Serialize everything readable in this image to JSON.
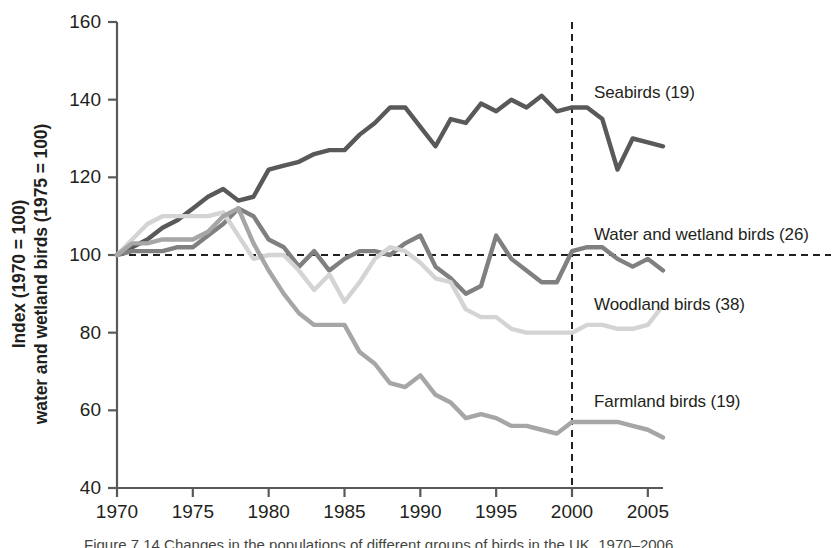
{
  "figure": {
    "background": "#ffffff",
    "plot_area": {
      "left": 117,
      "right": 663,
      "top": 22,
      "bottom": 488
    }
  },
  "axis": {
    "y_title_line1": "Index (1970 = 100)",
    "y_title_line2": "water and wetland birds (1975 = 100)",
    "y_ticks": [
      40,
      60,
      80,
      100,
      120,
      140,
      160
    ],
    "x_ticks": [
      1970,
      1975,
      1980,
      1985,
      1990,
      1995,
      2000,
      2005
    ],
    "axis_color": "#58595b"
  },
  "series_labels": [
    {
      "name": "seabirds-label",
      "text": "Seabirds (19)",
      "x": 594,
      "y": 83
    },
    {
      "name": "water-wetland-label",
      "text": "Water and wetland birds (26)",
      "x": 594,
      "y": 225
    },
    {
      "name": "woodland-label",
      "text": "Woodland birds (38)",
      "x": 594,
      "y": 295
    },
    {
      "name": "farmland-label",
      "text": "Farmland birds (19)",
      "x": 594,
      "y": 392
    }
  ],
  "reference_lines": {
    "horizontal_value": 100,
    "vertical_year": 2000,
    "color": "#231f20",
    "dash": "7,5"
  },
  "caption": "Figure 7.14 Changes in the populations of different groups of birds in the UK, 1970–2006",
  "chart_data": {
    "type": "line",
    "title": "",
    "xlabel": "",
    "ylabel": "Index (1970 = 100) water and wetland birds (1975 = 100)",
    "xlim": [
      1970,
      2006
    ],
    "ylim": [
      40,
      160
    ],
    "grid": false,
    "legend": "inline-right-labels",
    "x": [
      1970,
      1971,
      1972,
      1973,
      1974,
      1975,
      1976,
      1977,
      1978,
      1979,
      1980,
      1981,
      1982,
      1983,
      1984,
      1985,
      1986,
      1987,
      1988,
      1989,
      1990,
      1991,
      1992,
      1993,
      1994,
      1995,
      1996,
      1997,
      1998,
      1999,
      2000,
      2001,
      2002,
      2003,
      2004,
      2005,
      2006
    ],
    "series": [
      {
        "name": "Seabirds (19)",
        "color": "#595959",
        "count": 19,
        "values": [
          100,
          102,
          104,
          107,
          109,
          112,
          115,
          117,
          114,
          115,
          122,
          123,
          124,
          126,
          127,
          127,
          131,
          134,
          138,
          138,
          133,
          128,
          135,
          134,
          139,
          137,
          140,
          138,
          141,
          137,
          138,
          138,
          135,
          122,
          130,
          129,
          128
        ]
      },
      {
        "name": "Water and wetland birds (26)",
        "color": "#808080",
        "count": 26,
        "values": [
          100,
          101,
          101,
          101,
          102,
          102,
          105,
          108,
          112,
          110,
          104,
          102,
          97,
          101,
          96,
          99,
          101,
          101,
          100,
          103,
          105,
          97,
          94,
          90,
          92,
          105,
          99,
          96,
          93,
          93,
          101,
          102,
          102,
          99,
          97,
          99,
          96
        ]
      },
      {
        "name": "Woodland birds (38)",
        "color": "#d4d4d4",
        "count": 38,
        "values": [
          100,
          104,
          108,
          110,
          110,
          110,
          110,
          111,
          105,
          99,
          100,
          100,
          96,
          91,
          95,
          88,
          93,
          99,
          102,
          101,
          98,
          94,
          93,
          86,
          84,
          84,
          81,
          80,
          80,
          80,
          80,
          82,
          82,
          81,
          81,
          82,
          87
        ]
      },
      {
        "name": "Farmland birds (19)",
        "color": "#a6a6a6",
        "count": 19,
        "values": [
          100,
          103,
          103,
          104,
          104,
          104,
          106,
          110,
          112,
          103,
          96,
          90,
          85,
          82,
          82,
          82,
          75,
          72,
          67,
          66,
          69,
          64,
          62,
          58,
          59,
          58,
          56,
          56,
          55,
          54,
          57,
          57,
          57,
          57,
          56,
          55,
          53
        ]
      }
    ]
  }
}
